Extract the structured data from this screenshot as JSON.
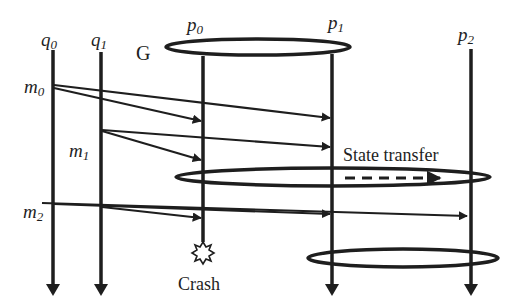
{
  "diagram": {
    "type": "message-sequence / group membership with state transfer",
    "processes": {
      "clients": [
        {
          "id": "q0",
          "label_base": "q",
          "label_sub": "0",
          "x": 53
        },
        {
          "id": "q1",
          "label_base": "q",
          "label_sub": "1",
          "x": 101
        }
      ],
      "group_members": [
        {
          "id": "p0",
          "label_base": "p",
          "label_sub": "0",
          "x": 203
        },
        {
          "id": "p1",
          "label_base": "p",
          "label_sub": "1",
          "x": 332
        },
        {
          "id": "p2",
          "label_base": "p",
          "label_sub": "2",
          "x": 471
        }
      ]
    },
    "group_label": "G",
    "messages": [
      {
        "label_base": "m",
        "label_sub": "0",
        "from": "q0",
        "to": [
          "p0",
          "p1"
        ]
      },
      {
        "label_base": "m",
        "label_sub": "1",
        "from": "q1",
        "to": [
          "p0",
          "p1"
        ]
      },
      {
        "label_base": "m",
        "label_sub": "2",
        "from": "q0",
        "to": [
          "p0",
          "p1",
          "p2"
        ]
      }
    ],
    "state_transfer_label": "State transfer",
    "crash_label": "Crash",
    "views": [
      {
        "name": "view-0",
        "members": [
          "p0",
          "p1"
        ]
      },
      {
        "name": "view-1",
        "members": [
          "p0",
          "p1",
          "p2"
        ]
      },
      {
        "name": "view-2",
        "members": [
          "p1",
          "p2"
        ]
      }
    ],
    "colors": {
      "ink": "#1e1e1e",
      "background": "#ffffff"
    }
  }
}
